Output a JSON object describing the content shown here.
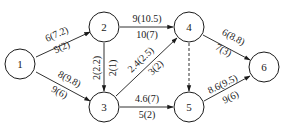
{
  "diagram": {
    "type": "flow-network",
    "nodes": [
      {
        "id": "1",
        "label": "1",
        "x": 20,
        "y": 64
      },
      {
        "id": "2",
        "label": "2",
        "x": 104,
        "y": 27
      },
      {
        "id": "3",
        "label": "3",
        "x": 104,
        "y": 107
      },
      {
        "id": "4",
        "label": "4",
        "x": 189,
        "y": 27
      },
      {
        "id": "5",
        "label": "5",
        "x": 189,
        "y": 107
      },
      {
        "id": "6",
        "label": "6",
        "x": 264,
        "y": 67
      }
    ],
    "edges": [
      {
        "from": "1",
        "to": "2",
        "top": "6(7.2)",
        "bottom": "5(2)",
        "style": "solid"
      },
      {
        "from": "1",
        "to": "3",
        "top": "8(9.8)",
        "bottom": "9(6)",
        "style": "solid"
      },
      {
        "from": "2",
        "to": "4",
        "top": "9(10.5)",
        "bottom": "10(7)",
        "style": "solid"
      },
      {
        "from": "2",
        "to": "3",
        "top": "2(2.2)",
        "bottom": "2(1)",
        "style": "solid"
      },
      {
        "from": "3",
        "to": "4",
        "top": "2.4(2.5)",
        "bottom": "3(2)",
        "style": "solid"
      },
      {
        "from": "3",
        "to": "5",
        "top": "4.6(7)",
        "bottom": "5(2)",
        "style": "solid"
      },
      {
        "from": "4",
        "to": "5",
        "top": "",
        "bottom": "",
        "style": "dashed"
      },
      {
        "from": "4",
        "to": "6",
        "top": "6(8.8)",
        "bottom": "7(3)",
        "style": "solid"
      },
      {
        "from": "5",
        "to": "6",
        "top": "8.6(9.5)",
        "bottom": "9(6)",
        "style": "solid"
      }
    ]
  }
}
